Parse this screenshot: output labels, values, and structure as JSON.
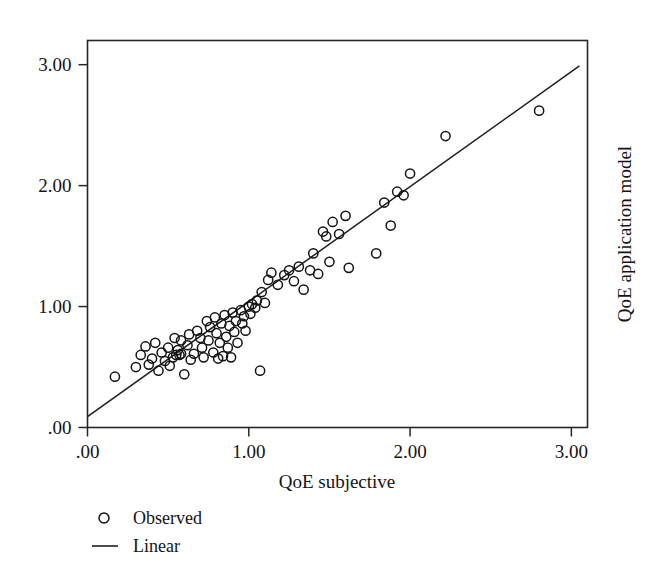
{
  "chart_data": {
    "type": "scatter",
    "title": "",
    "xlabel": "QoE subjective",
    "ylabel": "QoE application model",
    "xlim": [
      0.0,
      3.1
    ],
    "ylim": [
      0.0,
      3.2
    ],
    "grid": false,
    "legend_position": "below-left",
    "xticks": [
      ".00",
      "1.00",
      "2.00",
      "3.00"
    ],
    "xtick_values": [
      0,
      1,
      2,
      3
    ],
    "yticks": [
      ".00",
      "1.00",
      "2.00",
      "3.00"
    ],
    "ytick_values": [
      0,
      1,
      2,
      3
    ],
    "series": [
      {
        "name": "Observed",
        "type": "scatter",
        "marker": "open-circle",
        "color": "#141414",
        "points": [
          [
            0.17,
            0.42
          ],
          [
            0.3,
            0.5
          ],
          [
            0.33,
            0.6
          ],
          [
            0.36,
            0.67
          ],
          [
            0.38,
            0.52
          ],
          [
            0.4,
            0.57
          ],
          [
            0.42,
            0.7
          ],
          [
            0.44,
            0.47
          ],
          [
            0.46,
            0.62
          ],
          [
            0.48,
            0.55
          ],
          [
            0.5,
            0.66
          ],
          [
            0.51,
            0.51
          ],
          [
            0.53,
            0.58
          ],
          [
            0.54,
            0.74
          ],
          [
            0.55,
            0.6
          ],
          [
            0.56,
            0.64
          ],
          [
            0.57,
            0.6
          ],
          [
            0.58,
            0.72
          ],
          [
            0.58,
            0.61
          ],
          [
            0.6,
            0.44
          ],
          [
            0.62,
            0.68
          ],
          [
            0.63,
            0.77
          ],
          [
            0.64,
            0.56
          ],
          [
            0.66,
            0.61
          ],
          [
            0.68,
            0.8
          ],
          [
            0.7,
            0.74
          ],
          [
            0.71,
            0.66
          ],
          [
            0.72,
            0.58
          ],
          [
            0.74,
            0.88
          ],
          [
            0.75,
            0.72
          ],
          [
            0.76,
            0.83
          ],
          [
            0.78,
            0.62
          ],
          [
            0.79,
            0.91
          ],
          [
            0.8,
            0.78
          ],
          [
            0.81,
            0.57
          ],
          [
            0.82,
            0.7
          ],
          [
            0.83,
            0.86
          ],
          [
            0.84,
            0.59
          ],
          [
            0.85,
            0.93
          ],
          [
            0.86,
            0.75
          ],
          [
            0.87,
            0.66
          ],
          [
            0.88,
            0.84
          ],
          [
            0.89,
            0.58
          ],
          [
            0.9,
            0.95
          ],
          [
            0.91,
            0.79
          ],
          [
            0.92,
            0.88
          ],
          [
            0.93,
            0.7
          ],
          [
            0.95,
            0.97
          ],
          [
            0.96,
            0.86
          ],
          [
            0.97,
            0.92
          ],
          [
            0.98,
            0.8
          ],
          [
            1.0,
            1.0
          ],
          [
            1.01,
            0.94
          ],
          [
            1.02,
            1.02
          ],
          [
            1.04,
            0.99
          ],
          [
            1.05,
            1.05
          ],
          [
            1.07,
            0.47
          ],
          [
            1.08,
            1.12
          ],
          [
            1.1,
            1.03
          ],
          [
            1.12,
            1.22
          ],
          [
            1.14,
            1.28
          ],
          [
            1.18,
            1.18
          ],
          [
            1.22,
            1.26
          ],
          [
            1.25,
            1.3
          ],
          [
            1.28,
            1.21
          ],
          [
            1.31,
            1.33
          ],
          [
            1.34,
            1.14
          ],
          [
            1.38,
            1.3
          ],
          [
            1.4,
            1.44
          ],
          [
            1.43,
            1.27
          ],
          [
            1.46,
            1.62
          ],
          [
            1.48,
            1.58
          ],
          [
            1.5,
            1.37
          ],
          [
            1.52,
            1.7
          ],
          [
            1.56,
            1.6
          ],
          [
            1.6,
            1.75
          ],
          [
            1.62,
            1.32
          ],
          [
            1.79,
            1.44
          ],
          [
            1.84,
            1.86
          ],
          [
            1.88,
            1.67
          ],
          [
            1.92,
            1.95
          ],
          [
            1.96,
            1.92
          ],
          [
            2.0,
            2.1
          ],
          [
            2.22,
            2.41
          ],
          [
            2.8,
            2.62
          ]
        ]
      },
      {
        "name": "Linear",
        "type": "line",
        "color": "#1d1d1d",
        "intercept": 0.09,
        "slope": 0.953,
        "endpoints": [
          [
            0.0,
            0.09
          ],
          [
            3.05,
            2.99
          ]
        ]
      }
    ]
  },
  "legend": {
    "items": [
      {
        "label": "Observed",
        "marker": "open-circle"
      },
      {
        "label": "Linear",
        "marker": "line"
      }
    ]
  },
  "axes": {
    "x_title": "QoE subjective",
    "y_title_right": "QoE application model"
  }
}
